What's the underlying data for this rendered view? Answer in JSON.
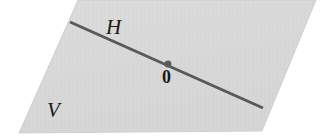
{
  "figure": {
    "background_color": "#ffffff",
    "width": 334,
    "height": 138
  },
  "plane": {
    "name": "V",
    "label": "V",
    "fill_color": "#d7d7d7",
    "edge_color": "#c7c7c7",
    "texture": "halftone-noise",
    "corners": [
      {
        "x": 78,
        "y": 0
      },
      {
        "x": 316,
        "y": 0
      },
      {
        "x": 262,
        "y": 131
      },
      {
        "x": 19,
        "y": 133
      }
    ],
    "label_position": {
      "x": 47,
      "y": 100
    }
  },
  "line": {
    "name": "H",
    "label": "H",
    "color": "#595959",
    "stroke_width": 3,
    "start": {
      "x": 70,
      "y": 22
    },
    "end": {
      "x": 263,
      "y": 108
    },
    "label_position": {
      "x": 106,
      "y": 17
    }
  },
  "origin": {
    "label": "0",
    "marker_color": "#595959",
    "marker_radius": 3.4,
    "position": {
      "x": 168,
      "y": 64
    },
    "label_position": {
      "x": 162,
      "y": 68
    }
  }
}
